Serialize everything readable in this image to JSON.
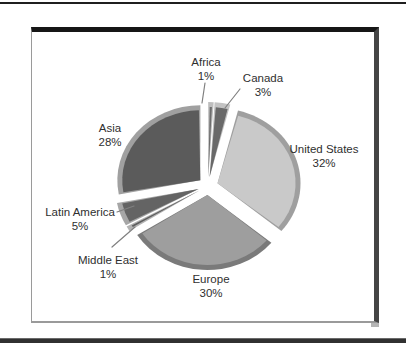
{
  "decor": {
    "background": "#ffffff",
    "top_rule_color": "#1f1f1f",
    "bottom_rule_color": "#313131",
    "frame_top_border_color": "#161616",
    "frame_right_border_color": "#454545",
    "frame_thin_border_color": "#9a9a9a",
    "leader_line_color": "#808080",
    "text_color": "#2f2f2f"
  },
  "chart_data": {
    "type": "pie",
    "title": "",
    "style": "3d-exploded",
    "unit": "%",
    "total": 100,
    "legend": "none",
    "labels_position": "outside",
    "slices": [
      {
        "label": "Africa",
        "value": 1,
        "pct_label": "1%",
        "color": "#6d6d6d",
        "rim_color": "#bdbdbd",
        "label_px": [
          206,
          66
        ],
        "leader": [
          205,
          83,
          202,
          103
        ]
      },
      {
        "label": "Canada",
        "value": 3,
        "pct_label": "3%",
        "color": "#696969",
        "rim_color": "#c2c2c2",
        "label_px": [
          263,
          82
        ],
        "leader": [
          240,
          89,
          225,
          108
        ]
      },
      {
        "label": "United States",
        "value": 32,
        "pct_label": "32%",
        "color": "#c9c9c9",
        "rim_color": "#9f9f9f",
        "label_px": [
          324,
          153
        ],
        "leader": null
      },
      {
        "label": "Europe",
        "value": 30,
        "pct_label": "30%",
        "color": "#9e9e9e",
        "rim_color": "#7a7a7a",
        "label_px": [
          211,
          283
        ],
        "leader": null
      },
      {
        "label": "Middle East",
        "value": 1,
        "pct_label": "1%",
        "color": "#5e5e5e",
        "rim_color": "#b3b3b3",
        "label_px": [
          108,
          264
        ],
        "leader": [
          112,
          247,
          135,
          227
        ]
      },
      {
        "label": "Latin America",
        "value": 5,
        "pct_label": "5%",
        "color": "#646464",
        "rim_color": "#a6a6a6",
        "label_px": [
          80,
          216
        ],
        "leader": [
          117,
          212,
          134,
          206
        ]
      },
      {
        "label": "Asia",
        "value": 28,
        "pct_label": "28%",
        "color": "#5b5b5b",
        "rim_color": "#a0a0a0",
        "label_px": [
          110,
          132
        ],
        "leader": null
      }
    ],
    "layout": {
      "cx": 208,
      "cy": 186,
      "rx": 78,
      "ry": 70,
      "explode": 10,
      "explode_y_scale": 0.9,
      "pad_deg": 1.0,
      "rim_pad_deg": 1.1,
      "rim_extra": 5,
      "start_angle_deg": 0,
      "direction": "clockwise",
      "label_line_gap": 14
    }
  }
}
